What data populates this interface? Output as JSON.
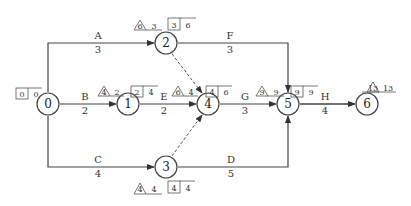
{
  "diagram": {
    "type": "activity-on-arrow network (double-code network)",
    "nodes": [
      {
        "id": "0",
        "label": "0",
        "x": 48,
        "y": 104,
        "ES": "0",
        "LS": "0",
        "slack_tri": null,
        "tri_val": null
      },
      {
        "id": "1",
        "label": "1",
        "x": 128,
        "y": 104,
        "tri": "4",
        "tri_val": "2",
        "box1": "2",
        "box2": "4"
      },
      {
        "id": "2",
        "label": "2",
        "x": 166,
        "y": 43,
        "tri": "6",
        "tri_val": "3",
        "box1": "3",
        "box2": "6"
      },
      {
        "id": "3",
        "label": "3",
        "x": 166,
        "y": 167,
        "tri": "4",
        "tri_val": "4",
        "box1": "4",
        "box2": "4"
      },
      {
        "id": "4",
        "label": "4",
        "x": 208,
        "y": 104,
        "tri": "6",
        "tri_val": "4",
        "box1": "4",
        "box2": "6"
      },
      {
        "id": "5",
        "label": "5",
        "x": 288,
        "y": 104,
        "tri": "9",
        "tri_val": "9",
        "box1": "9",
        "box2": "9"
      },
      {
        "id": "6",
        "label": "6",
        "x": 367,
        "y": 104,
        "tri": "13",
        "tri_val": "13"
      }
    ],
    "start_box": {
      "box1": "0",
      "val": "0"
    },
    "activities": [
      {
        "name": "A",
        "duration": "3",
        "from": "0",
        "to": "2"
      },
      {
        "name": "B",
        "duration": "2",
        "from": "0",
        "to": "1"
      },
      {
        "name": "C",
        "duration": "4",
        "from": "0",
        "to": "3"
      },
      {
        "name": "E",
        "duration": "2",
        "from": "1",
        "to": "4"
      },
      {
        "name": "F",
        "duration": "3",
        "from": "2",
        "to": "5"
      },
      {
        "name": "G",
        "duration": "3",
        "from": "4",
        "to": "5"
      },
      {
        "name": "D",
        "duration": "5",
        "from": "3",
        "to": "5"
      },
      {
        "name": "H",
        "duration": "4",
        "from": "5",
        "to": "6"
      }
    ],
    "dummies": [
      {
        "from": "2",
        "to": "4"
      },
      {
        "from": "3",
        "to": "4"
      }
    ],
    "colors": {
      "line": "#333333",
      "text": "#333333",
      "bg": "#ffffff"
    }
  }
}
